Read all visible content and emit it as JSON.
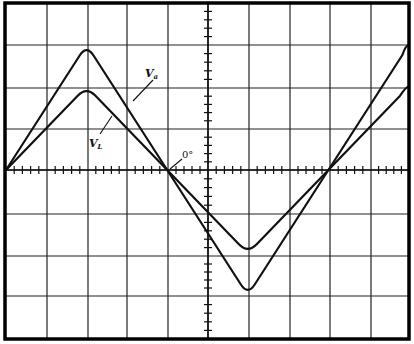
{
  "figure": {
    "type": "oscilloscope-waveform-diagram",
    "background_color": "#ffffff",
    "ink_color": "#111111",
    "grid": {
      "columns": 10,
      "rows": 8,
      "minor_ticks_per_division": 5,
      "x_lines": [
        6,
        47,
        88,
        127,
        168,
        208,
        249,
        290,
        330,
        371,
        409
      ],
      "y_lines": [
        3,
        45,
        88,
        129,
        170,
        214,
        256,
        296,
        339
      ],
      "center_x": 208,
      "center_y": 170
    },
    "labels": {
      "va": {
        "main": "V",
        "sub": "a"
      },
      "vl": {
        "main": "V",
        "sub": "L"
      },
      "phase": "0°"
    }
  },
  "chart_data": {
    "type": "line",
    "title": "",
    "xlabel": "",
    "ylabel": "",
    "grid": true,
    "x_divisions": 10,
    "y_divisions": 8,
    "xlim": [
      0,
      10
    ],
    "ylim": [
      -4,
      4
    ],
    "annotations": [
      {
        "text": "Va",
        "target": "Va"
      },
      {
        "text": "VL",
        "target": "VL"
      },
      {
        "text": "0°",
        "target": "zero crossing at x=4"
      }
    ],
    "series": [
      {
        "name": "Va",
        "x": [
          0,
          2,
          4,
          6,
          8,
          10
        ],
        "values": [
          0,
          3,
          0,
          -3,
          0,
          3
        ]
      },
      {
        "name": "VL",
        "x": [
          0,
          2,
          4,
          6,
          8,
          10
        ],
        "values": [
          0,
          2,
          0,
          -2,
          0,
          2
        ]
      }
    ]
  }
}
